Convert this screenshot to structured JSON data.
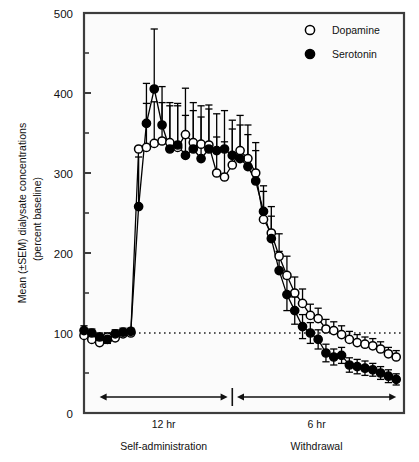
{
  "chart_data": {
    "type": "line",
    "title": "",
    "xlabel": "",
    "ylabel": "Mean (±SEM) dialysate concentrations",
    "ylabel2": "(percent baseline)",
    "ylim": [
      0,
      500
    ],
    "ytick_labels": [
      "0",
      "100",
      "200",
      "300",
      "400",
      "500"
    ],
    "ytick_values": [
      0,
      100,
      200,
      300,
      400,
      500
    ],
    "yminor_values": [
      50,
      150,
      250,
      350,
      450
    ],
    "grid": false,
    "legend_position": "top-right",
    "reference_line": {
      "value": 100,
      "style": "dotted",
      "label": ""
    },
    "x_range": [
      0,
      41
    ],
    "phase_divider_x": 19,
    "annotations": [
      {
        "name": "self-administration-arrow",
        "label": "12 hr",
        "caption": "Self-administration",
        "x_start": 2,
        "x_end": 18.4
      },
      {
        "name": "withdrawal-arrow",
        "label": "6 hr",
        "caption": "Withdrawal",
        "x_start": 19.6,
        "x_end": 40
      }
    ],
    "series": [
      {
        "name": "Dopamine",
        "marker": "open-circle",
        "color": "#000000",
        "x": [
          0,
          1,
          2,
          3,
          4,
          5,
          6,
          7,
          8,
          9,
          10,
          11,
          12,
          13,
          14,
          15,
          16,
          17,
          18,
          19,
          20,
          21,
          22,
          23,
          24,
          25,
          26,
          27,
          28,
          29,
          30,
          31,
          32,
          33,
          34,
          35,
          36,
          37,
          38,
          39,
          40
        ],
        "values": [
          97,
          92,
          88,
          95,
          94,
          99,
          100,
          330,
          332,
          337,
          340,
          338,
          332,
          348,
          338,
          336,
          335,
          300,
          295,
          310,
          328,
          318,
          300,
          242,
          225,
          196,
          172,
          150,
          137,
          122,
          118,
          105,
          103,
          98,
          92,
          88,
          86,
          84,
          80,
          74,
          70
        ],
        "errors": [
          6,
          5,
          5,
          5,
          5,
          5,
          4,
          0,
          55,
          52,
          48,
          50,
          52,
          58,
          50,
          48,
          50,
          45,
          44,
          45,
          44,
          42,
          38,
          35,
          33,
          28,
          24,
          20,
          18,
          14,
          13,
          12,
          11,
          11,
          10,
          10,
          9,
          9,
          9,
          8,
          8
        ]
      },
      {
        "name": "Serotonin",
        "marker": "filled-circle",
        "color": "#000000",
        "x": [
          0,
          1,
          2,
          3,
          4,
          5,
          6,
          7,
          8,
          9,
          10,
          11,
          12,
          13,
          14,
          15,
          16,
          17,
          18,
          19,
          20,
          21,
          22,
          23,
          24,
          25,
          26,
          27,
          28,
          29,
          30,
          31,
          32,
          33,
          34,
          35,
          36,
          37,
          38,
          39,
          40
        ],
        "values": [
          103,
          100,
          95,
          92,
          99,
          101,
          102,
          258,
          362,
          405,
          360,
          330,
          335,
          322,
          330,
          318,
          330,
          328,
          330,
          322,
          318,
          308,
          290,
          252,
          218,
          178,
          148,
          128,
          108,
          100,
          92,
          75,
          70,
          72,
          60,
          58,
          56,
          54,
          50,
          46,
          42
        ],
        "errors": [
          6,
          5,
          5,
          5,
          5,
          5,
          4,
          62,
          50,
          75,
          48,
          54,
          52,
          50,
          48,
          52,
          50,
          46,
          48,
          44,
          42,
          40,
          38,
          32,
          28,
          24,
          20,
          17,
          15,
          13,
          12,
          11,
          10,
          10,
          9,
          9,
          9,
          8,
          8,
          8,
          7
        ]
      }
    ]
  },
  "legend": {
    "items": [
      {
        "label": "Dopamine",
        "marker": "open-circle"
      },
      {
        "label": "Serotonin",
        "marker": "filled-circle"
      }
    ]
  },
  "colors": {
    "axis": "#3d3d3d",
    "marker": "#000000",
    "background": "#fbfbfb",
    "reference": "#222222"
  }
}
